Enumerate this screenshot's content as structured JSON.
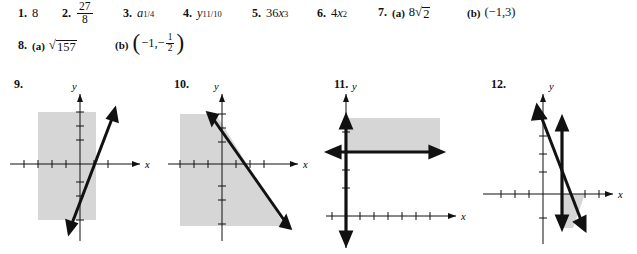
{
  "page": {
    "kind": "textbook-answer-key",
    "shade_color": "#d6d6d6",
    "ink_color": "#111111"
  },
  "answers": [
    {
      "number": "1.",
      "parts": [
        {
          "label": "",
          "type": "plain",
          "text": "8"
        }
      ]
    },
    {
      "number": "2.",
      "parts": [
        {
          "label": "",
          "type": "fraction",
          "numerator": "27",
          "denominator": "8"
        }
      ]
    },
    {
      "number": "3.",
      "parts": [
        {
          "label": "",
          "type": "power-fraction",
          "base": "a",
          "exp_num": "1",
          "exp_den": "4"
        }
      ]
    },
    {
      "number": "4.",
      "parts": [
        {
          "label": "",
          "type": "power-fraction",
          "base": "y",
          "exp_num": "11",
          "exp_den": "10"
        }
      ]
    },
    {
      "number": "5.",
      "parts": [
        {
          "label": "",
          "type": "monomial",
          "coef": "36",
          "var": "x",
          "exp": "3"
        }
      ]
    },
    {
      "number": "6.",
      "parts": [
        {
          "label": "",
          "type": "monomial",
          "coef": "4",
          "var": "x",
          "exp": "2"
        }
      ]
    },
    {
      "number": "7.",
      "parts": [
        {
          "label": "(a)",
          "type": "radical-coef",
          "coef": "8",
          "radicand": "2"
        },
        {
          "label": "(b)",
          "type": "plain",
          "text": "(−1,3)"
        }
      ]
    },
    {
      "number": "8.",
      "parts": [
        {
          "label": "(a)",
          "type": "radical",
          "radicand": "157"
        },
        {
          "label": "(b)",
          "type": "ordered-pair-fraction",
          "first": "−1,",
          "second_sign": "−",
          "num": "1",
          "den": "2"
        }
      ]
    }
  ],
  "graphs": [
    {
      "number": "9.",
      "y_label": "y",
      "x_label": "x",
      "description": "linear-inequality-shaded-left-of-increasing-line",
      "shade_color": "#d6d6d6"
    },
    {
      "number": "10.",
      "y_label": "y",
      "x_label": "x",
      "description": "linear-inequality-shaded-below-decreasing-line",
      "shade_color": "#d6d6d6"
    },
    {
      "number": "11.",
      "y_label": "y",
      "x_label": "x",
      "description": "system-shaded-rectangle-above-horizontal-right-of-vertical",
      "shade_color": "#d6d6d6"
    },
    {
      "number": "12.",
      "y_label": "y",
      "x_label": "x",
      "description": "system-shaded-triangle-below-x-axis",
      "shade_color": "#d6d6d6"
    }
  ]
}
